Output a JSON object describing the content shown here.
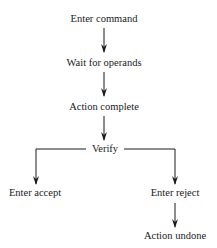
{
  "diagram": {
    "type": "flowchart",
    "nodes": {
      "enter_command": "Enter command",
      "wait_for_operands": "Wait for operands",
      "action_complete": "Action complete",
      "verify": "Verify",
      "enter_accept": "Enter accept",
      "enter_reject": "Enter reject",
      "action_undone": "Action undone"
    },
    "edges": [
      {
        "from": "Enter command",
        "to": "Wait for operands"
      },
      {
        "from": "Wait for operands",
        "to": "Action complete"
      },
      {
        "from": "Action complete",
        "to": "Verify"
      },
      {
        "from": "Verify",
        "to": "Enter accept"
      },
      {
        "from": "Verify",
        "to": "Enter reject"
      },
      {
        "from": "Enter reject",
        "to": "Action undone"
      }
    ],
    "colors": {
      "line": "#1a1a1a",
      "text": "#1a1a1a",
      "background": "#ffffff"
    }
  }
}
